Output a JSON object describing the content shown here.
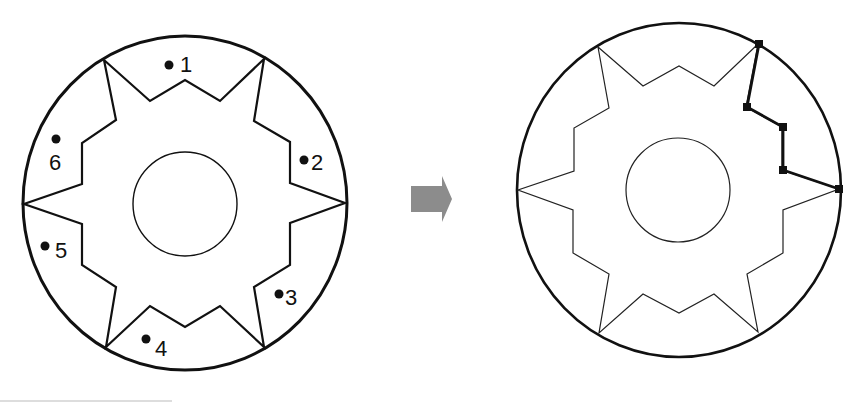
{
  "figure": {
    "left": {
      "title": "gear-outline-with-regions",
      "outer_circle": {
        "cx": 185,
        "cy": 203,
        "rx": 162,
        "ry": 167
      },
      "inner_circle": {
        "cx": 185,
        "cy": 204,
        "r": 52
      },
      "regions": [
        {
          "label": "1",
          "dot": [
            169,
            65
          ],
          "text": [
            182,
            71
          ]
        },
        {
          "label": "2",
          "dot": [
            304,
            160
          ],
          "text": [
            312,
            170
          ]
        },
        {
          "label": "3",
          "dot": [
            279,
            294
          ],
          "text": [
            286,
            305
          ]
        },
        {
          "label": "4",
          "dot": [
            146,
            339
          ],
          "text": [
            156,
            355
          ]
        },
        {
          "label": "5",
          "dot": [
            45,
            246
          ],
          "text": [
            56,
            258
          ]
        },
        {
          "label": "6",
          "dot": [
            56,
            139
          ],
          "text": [
            49,
            170
          ]
        }
      ]
    },
    "arrow": {
      "color": "#8c8c8c",
      "direction": "right"
    },
    "right": {
      "title": "gear-outline-with-highlighted-segment",
      "outer_circle": {
        "cx": 679,
        "cy": 190,
        "rx": 162,
        "ry": 167
      },
      "inner_circle": {
        "cx": 678,
        "cy": 190,
        "r": 52
      },
      "highlight_nodes": [
        [
          759,
          44
        ],
        [
          747,
          107
        ],
        [
          783,
          127
        ],
        [
          783,
          170
        ],
        [
          839,
          189
        ]
      ]
    },
    "colors": {
      "stroke": "#111111",
      "arrow": "#8c8c8c",
      "background": "#ffffff"
    }
  }
}
